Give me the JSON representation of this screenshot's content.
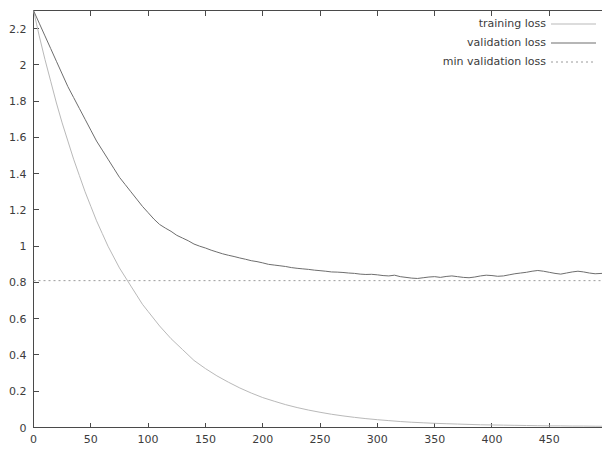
{
  "chart_data": {
    "type": "line",
    "title": "",
    "xlabel": "",
    "ylabel": "",
    "xlim": [
      0,
      496
    ],
    "ylim": [
      0,
      2.3
    ],
    "grid": false,
    "legend_position": "top-right",
    "xticks": [
      0,
      50,
      100,
      150,
      200,
      250,
      300,
      350,
      400,
      450
    ],
    "yticks": [
      0,
      0.2,
      0.4,
      0.6,
      0.8,
      1,
      1.2,
      1.4,
      1.6,
      1.8,
      2,
      2.2
    ],
    "xtick_labels": [
      "0",
      "50",
      "100",
      "150",
      "200",
      "250",
      "300",
      "350",
      "400",
      "450"
    ],
    "ytick_labels": [
      "0",
      "0.2",
      "0.4",
      "0.6",
      "0.8",
      "1",
      "1.2",
      "1.4",
      "1.6",
      "1.8",
      "2",
      "2.2"
    ],
    "annotations": [
      {
        "name": "min-validation-loss-level",
        "value": 0.81
      }
    ],
    "series": [
      {
        "name": "training loss",
        "color": "#b9b9b9",
        "style": "solid",
        "x": [
          0,
          5,
          10,
          15,
          20,
          25,
          30,
          35,
          40,
          45,
          50,
          55,
          60,
          65,
          70,
          75,
          80,
          85,
          90,
          95,
          100,
          110,
          120,
          130,
          140,
          150,
          160,
          170,
          180,
          190,
          200,
          210,
          220,
          230,
          240,
          250,
          260,
          270,
          280,
          290,
          300,
          310,
          320,
          330,
          340,
          350,
          360,
          370,
          380,
          390,
          400,
          410,
          420,
          430,
          440,
          450,
          460,
          470,
          480,
          490,
          496
        ],
        "values": [
          2.3,
          2.16,
          2.03,
          1.91,
          1.79,
          1.68,
          1.58,
          1.48,
          1.39,
          1.3,
          1.22,
          1.14,
          1.07,
          1.0,
          0.94,
          0.88,
          0.83,
          0.78,
          0.73,
          0.68,
          0.64,
          0.56,
          0.49,
          0.43,
          0.37,
          0.325,
          0.285,
          0.25,
          0.218,
          0.19,
          0.165,
          0.145,
          0.126,
          0.11,
          0.096,
          0.084,
          0.073,
          0.064,
          0.056,
          0.049,
          0.043,
          0.038,
          0.033,
          0.029,
          0.026,
          0.023,
          0.021,
          0.019,
          0.017,
          0.015,
          0.014,
          0.013,
          0.012,
          0.011,
          0.01,
          0.009,
          0.009,
          0.008,
          0.008,
          0.007,
          0.007
        ]
      },
      {
        "name": "validation loss",
        "color": "#6e6e6e",
        "style": "solid",
        "x": [
          0,
          5,
          10,
          15,
          20,
          25,
          30,
          35,
          40,
          45,
          50,
          55,
          60,
          65,
          70,
          75,
          80,
          85,
          90,
          95,
          100,
          105,
          110,
          115,
          120,
          125,
          130,
          135,
          140,
          145,
          150,
          155,
          160,
          165,
          170,
          175,
          180,
          185,
          190,
          195,
          200,
          205,
          210,
          215,
          220,
          225,
          230,
          235,
          240,
          245,
          250,
          255,
          260,
          265,
          270,
          275,
          280,
          285,
          290,
          295,
          300,
          305,
          310,
          315,
          320,
          325,
          330,
          335,
          340,
          345,
          350,
          355,
          360,
          365,
          370,
          375,
          380,
          385,
          390,
          395,
          400,
          405,
          410,
          415,
          420,
          425,
          430,
          435,
          440,
          445,
          450,
          455,
          460,
          465,
          470,
          475,
          480,
          485,
          490,
          496
        ],
        "values": [
          2.3,
          2.23,
          2.16,
          2.09,
          2.02,
          1.95,
          1.88,
          1.82,
          1.76,
          1.7,
          1.64,
          1.58,
          1.53,
          1.48,
          1.43,
          1.38,
          1.34,
          1.3,
          1.26,
          1.22,
          1.185,
          1.15,
          1.12,
          1.1,
          1.082,
          1.06,
          1.045,
          1.03,
          1.012,
          1.0,
          0.99,
          0.978,
          0.968,
          0.958,
          0.95,
          0.943,
          0.935,
          0.928,
          0.92,
          0.915,
          0.908,
          0.9,
          0.896,
          0.892,
          0.888,
          0.882,
          0.878,
          0.875,
          0.872,
          0.868,
          0.865,
          0.862,
          0.858,
          0.857,
          0.855,
          0.852,
          0.85,
          0.846,
          0.844,
          0.845,
          0.842,
          0.838,
          0.836,
          0.84,
          0.832,
          0.828,
          0.824,
          0.822,
          0.826,
          0.83,
          0.832,
          0.828,
          0.833,
          0.836,
          0.832,
          0.828,
          0.826,
          0.83,
          0.836,
          0.84,
          0.838,
          0.834,
          0.836,
          0.842,
          0.848,
          0.852,
          0.856,
          0.862,
          0.866,
          0.862,
          0.856,
          0.85,
          0.846,
          0.852,
          0.858,
          0.862,
          0.858,
          0.852,
          0.848,
          0.85
        ]
      },
      {
        "name": "min validation loss",
        "color": "#9a9a9a",
        "style": "dotted",
        "constant": 0.81
      }
    ]
  },
  "legend": {
    "items": [
      {
        "label": "training loss",
        "style": "solid",
        "color": "#b9b9b9"
      },
      {
        "label": "validation loss",
        "style": "solid",
        "color": "#6e6e6e"
      },
      {
        "label": "min validation loss",
        "style": "dotted",
        "color": "#9a9a9a"
      }
    ]
  }
}
